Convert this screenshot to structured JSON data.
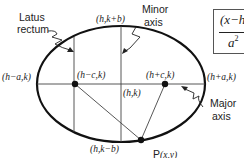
{
  "diagram": {
    "type": "ellipse",
    "labels": {
      "latus_rectum_line1": "Latus",
      "latus_rectum_line2": "rectum",
      "minor_axis_line1": "Minor",
      "minor_axis_line2": "axis",
      "major_axis_line1": "Major",
      "major_axis_line2": "axis",
      "top_vertex": "(h,k+b)",
      "bottom_vertex": "(h,k−b)",
      "left_vertex": "(h−a,k)",
      "right_vertex": "(h+a,k)",
      "left_focus": "(h−c,k)",
      "right_focus": "(h+c,k)",
      "center": "(h,k)",
      "point_p_letter": "P",
      "point_p_coords": "(x,y)"
    },
    "formula": {
      "numerator": "(x−h",
      "denominator": "a",
      "denominator_exp": "2"
    },
    "colors": {
      "stroke": "#111111",
      "thin_line": "#444444",
      "text": "#222222"
    }
  }
}
